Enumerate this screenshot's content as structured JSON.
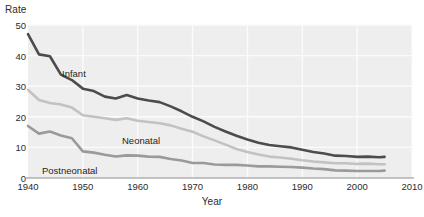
{
  "chart_data": {
    "type": "line",
    "title": "",
    "xlabel": "Year",
    "ylabel": "Rate",
    "xlim": [
      1940,
      2010
    ],
    "ylim": [
      0,
      50
    ],
    "grid": true,
    "legend_position": "inline-labels",
    "xticks": [
      1940,
      1950,
      1960,
      1970,
      1980,
      1990,
      2000,
      2010
    ],
    "yticks": [
      0,
      10,
      20,
      30,
      40,
      50
    ],
    "x": [
      1940,
      1942,
      1944,
      1946,
      1948,
      1950,
      1952,
      1954,
      1956,
      1958,
      1960,
      1962,
      1964,
      1966,
      1968,
      1970,
      1972,
      1974,
      1976,
      1978,
      1980,
      1982,
      1984,
      1986,
      1988,
      1990,
      1992,
      1994,
      1996,
      1998,
      2000,
      2002,
      2004,
      2005
    ],
    "series": [
      {
        "name": "Infant",
        "color": "#4c4c4c",
        "values": [
          47.0,
          40.4,
          39.8,
          33.8,
          32.0,
          29.2,
          28.4,
          26.6,
          26.0,
          27.1,
          26.0,
          25.3,
          24.8,
          23.4,
          21.8,
          20.0,
          18.5,
          16.7,
          15.2,
          13.8,
          12.6,
          11.5,
          10.8,
          10.4,
          10.0,
          9.2,
          8.5,
          8.0,
          7.3,
          7.2,
          6.9,
          7.0,
          6.8,
          6.9
        ]
      },
      {
        "name": "Neonatal",
        "color": "#c2c2c2",
        "values": [
          28.8,
          25.5,
          24.5,
          24.0,
          23.0,
          20.5,
          20.0,
          19.5,
          19.0,
          19.5,
          18.7,
          18.3,
          17.9,
          17.2,
          16.1,
          15.1,
          13.6,
          12.3,
          10.9,
          9.5,
          8.5,
          7.7,
          7.0,
          6.7,
          6.3,
          5.8,
          5.4,
          5.1,
          4.8,
          4.8,
          4.6,
          4.7,
          4.5,
          4.5
        ]
      },
      {
        "name": "Postneonatal",
        "color": "#9a9a9a",
        "values": [
          17.0,
          14.5,
          15.2,
          13.9,
          13.0,
          8.7,
          8.3,
          7.6,
          7.0,
          7.4,
          7.3,
          7.0,
          6.9,
          6.2,
          5.7,
          4.9,
          4.9,
          4.4,
          4.3,
          4.3,
          4.1,
          3.8,
          3.8,
          3.7,
          3.6,
          3.4,
          3.1,
          2.9,
          2.5,
          2.4,
          2.3,
          2.3,
          2.3,
          2.4
        ]
      }
    ],
    "series_label_positions": [
      {
        "name": "Infant",
        "x": 62,
        "y": 68
      },
      {
        "name": "Neonatal",
        "x": 122,
        "y": 135
      },
      {
        "name": "Postneonatal",
        "x": 42,
        "y": 165
      }
    ],
    "colors": {
      "infant": "#4c4c4c",
      "neonatal": "#c2c2c2",
      "postneonatal": "#9a9a9a",
      "plot_background": "#eeeeee",
      "gridline": "#fbfbfb",
      "axis": "#8d8d8d",
      "text": "#2b2b2b"
    }
  },
  "axes": {
    "y_title": "Rate",
    "x_title": "Year",
    "y_tick_labels": [
      "0",
      "10",
      "20",
      "30",
      "40",
      "50"
    ],
    "x_tick_labels": [
      "1940",
      "1950",
      "1960",
      "1970",
      "1980",
      "1990",
      "2000",
      "2010"
    ]
  },
  "series_labels": {
    "infant": "Infant",
    "neonatal": "Neonatal",
    "postneonatal": "Postneonatal"
  }
}
